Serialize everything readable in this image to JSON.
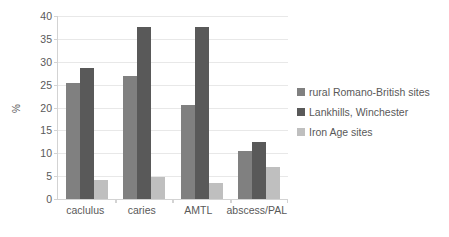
{
  "chart_data": {
    "type": "bar",
    "title": "",
    "xlabel": "",
    "ylabel": "%",
    "ylim": [
      0,
      40
    ],
    "yticks": [
      0,
      5,
      10,
      15,
      20,
      25,
      30,
      35,
      40
    ],
    "grid": true,
    "legend_position": "right",
    "categories": [
      "caclulus",
      "caries",
      "AMTL",
      "abscess/PAL"
    ],
    "series": [
      {
        "name": "rural Romano-British sites",
        "color": "#808080",
        "values": [
          25.4,
          26.9,
          20.5,
          10.5
        ]
      },
      {
        "name": "Lankhills, Winchester",
        "color": "#595959",
        "values": [
          28.6,
          37.7,
          37.7,
          12.4
        ]
      },
      {
        "name": "Iron Age sites",
        "color": "#bfbfbf",
        "values": [
          4.2,
          4.9,
          3.6,
          6.9
        ]
      }
    ]
  },
  "axis": {
    "y_title": "%",
    "tick_labels": [
      "40",
      "35",
      "30",
      "25",
      "20",
      "15",
      "10",
      "5",
      "0"
    ]
  },
  "legend": {
    "items": [
      {
        "label": "rural Romano-British sites",
        "color": "#808080"
      },
      {
        "label": "Lankhills, Winchester",
        "color": "#595959"
      },
      {
        "label": "Iron Age sites",
        "color": "#bfbfbf"
      }
    ]
  },
  "colors": {
    "gridline": "#e8e8e8",
    "axis": "#d3d3d3",
    "text": "#595959",
    "background": "#ffffff"
  }
}
